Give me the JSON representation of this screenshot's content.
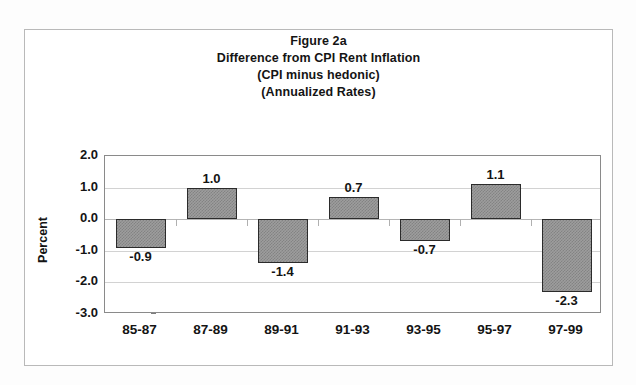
{
  "figure": {
    "title_lines": [
      "Figure 2a",
      "Difference from CPI Rent Inflation",
      "(CPI minus hedonic)",
      "(Annualized Rates)"
    ]
  },
  "chart_data": {
    "type": "bar",
    "title": "Figure 2a\nDifference from CPI Rent Inflation\n(CPI minus hedonic)\n(Annualized Rates)",
    "categories": [
      "85-87",
      "87-89",
      "89-91",
      "91-93",
      "93-95",
      "95-97",
      "97-99"
    ],
    "values": [
      -0.9,
      1.0,
      -1.4,
      0.7,
      -0.7,
      1.1,
      -2.3
    ],
    "value_labels": [
      "-0.9",
      "1.0",
      "-1.4",
      "0.7",
      "-0.7",
      "1.1",
      "-2.3"
    ],
    "xlabel": "",
    "ylabel": "Percent",
    "ylim": [
      -3.0,
      2.0
    ],
    "ytick_labels": [
      "2.0",
      "1.0",
      "0.0",
      "-1.0",
      "-2.0",
      "-3.0"
    ],
    "ytick_values": [
      2.0,
      1.0,
      0.0,
      -1.0,
      -2.0,
      -3.0
    ],
    "grid": true,
    "legend": null,
    "bar_color": "#9d9d9d",
    "bar_border_color": "#2b2b2b",
    "plot_border_color": "#8a8a8a",
    "gridline_color": "#d2d2d2"
  }
}
